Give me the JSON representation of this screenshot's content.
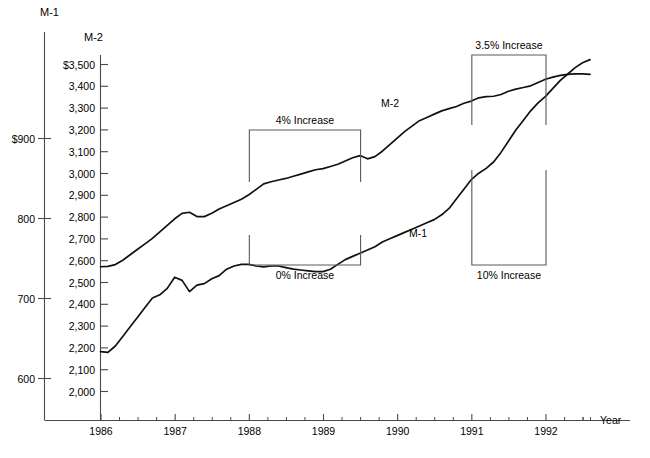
{
  "chart_data": {
    "type": "line",
    "title": "",
    "xlabel": "Year",
    "grid": false,
    "legend_position": "inline-annotations",
    "axes": {
      "x": {
        "label": "Year",
        "tick_labels": [
          "1986",
          "1987",
          "1988",
          "1989",
          "1990",
          "1991",
          "1992"
        ],
        "minor_ticks_per_interval": 4,
        "range": [
          1985.75,
          1992.9
        ]
      },
      "y_left": {
        "name": "M-1",
        "label": "M-1",
        "tick_labels": [
          "$900",
          "800",
          "700",
          "600"
        ],
        "values": [
          900,
          800,
          700,
          600
        ],
        "range": [
          550,
          950
        ]
      },
      "y_right_inner": {
        "name": "M-2",
        "label": "M-2",
        "tick_labels": [
          "$3,500",
          "3,400",
          "3,300",
          "3,200",
          "3,100",
          "3,000",
          "2,900",
          "2,800",
          "2,700",
          "2,600",
          "2,500",
          "2,400",
          "2,300",
          "2,200",
          "2,100",
          "2,000"
        ],
        "values": [
          3500,
          3400,
          3300,
          3200,
          3100,
          3000,
          2900,
          2800,
          2700,
          2600,
          2500,
          2400,
          2300,
          2200,
          2100,
          2000
        ],
        "range": [
          1850,
          3600
        ]
      }
    },
    "series": [
      {
        "name": "M-2",
        "inline_label": "M-2",
        "axis": "y_right_inner",
        "unit": "billions of dollars",
        "x": [
          1986.0,
          1986.1,
          1986.2,
          1986.3,
          1986.4,
          1986.5,
          1986.6,
          1986.7,
          1986.8,
          1986.9,
          1987.0,
          1987.1,
          1987.2,
          1987.3,
          1987.4,
          1987.5,
          1987.6,
          1987.7,
          1987.8,
          1987.9,
          1988.0,
          1988.1,
          1988.2,
          1988.3,
          1988.4,
          1988.5,
          1988.6,
          1988.7,
          1988.8,
          1988.9,
          1989.0,
          1989.1,
          1989.2,
          1989.3,
          1989.4,
          1989.5,
          1989.6,
          1989.7,
          1989.8,
          1989.9,
          1990.0,
          1990.1,
          1990.2,
          1990.3,
          1990.4,
          1990.5,
          1990.6,
          1990.7,
          1990.8,
          1990.9,
          1991.0,
          1991.1,
          1991.2,
          1991.3,
          1991.4,
          1991.5,
          1991.6,
          1991.7,
          1991.8,
          1991.9,
          1992.0,
          1992.1,
          1992.2,
          1992.3,
          1992.4,
          1992.5,
          1992.6
        ],
        "values": [
          2570,
          2572,
          2580,
          2600,
          2625,
          2650,
          2675,
          2700,
          2730,
          2760,
          2790,
          2815,
          2820,
          2800,
          2800,
          2815,
          2835,
          2850,
          2865,
          2880,
          2900,
          2925,
          2950,
          2960,
          2968,
          2975,
          2985,
          2995,
          3005,
          3015,
          3020,
          3030,
          3040,
          3055,
          3070,
          3080,
          3065,
          3075,
          3100,
          3130,
          3160,
          3190,
          3215,
          3240,
          3255,
          3270,
          3285,
          3295,
          3305,
          3320,
          3330,
          3345,
          3350,
          3352,
          3360,
          3375,
          3385,
          3392,
          3400,
          3415,
          3430,
          3440,
          3448,
          3452,
          3455,
          3455,
          3452
        ]
      },
      {
        "name": "M-1",
        "inline_label": "M-1",
        "axis": "y_left",
        "unit": "billions of dollars",
        "x": [
          1986.0,
          1986.1,
          1986.2,
          1986.3,
          1986.4,
          1986.5,
          1986.6,
          1986.7,
          1986.8,
          1986.9,
          1987.0,
          1987.1,
          1987.2,
          1987.3,
          1987.4,
          1987.5,
          1987.6,
          1987.7,
          1987.8,
          1987.9,
          1988.0,
          1988.1,
          1988.2,
          1988.3,
          1988.4,
          1988.5,
          1988.6,
          1988.7,
          1988.8,
          1988.9,
          1989.0,
          1989.1,
          1989.2,
          1989.3,
          1989.4,
          1989.5,
          1989.6,
          1989.7,
          1989.8,
          1989.9,
          1990.0,
          1990.1,
          1990.2,
          1990.3,
          1990.4,
          1990.5,
          1990.6,
          1990.7,
          1990.8,
          1990.9,
          1991.0,
          1991.1,
          1991.2,
          1991.3,
          1991.4,
          1991.5,
          1991.6,
          1991.7,
          1991.8,
          1991.9,
          1992.0,
          1992.1,
          1992.2,
          1992.3,
          1992.4,
          1992.5,
          1992.6
        ],
        "values": [
          633,
          632,
          640,
          652,
          664,
          676,
          688,
          700,
          704,
          712,
          726,
          722,
          708,
          716,
          718,
          724,
          728,
          736,
          740,
          742,
          742,
          740,
          739,
          740,
          740,
          738,
          736,
          735,
          734,
          733,
          733,
          736,
          742,
          748,
          752,
          756,
          760,
          764,
          770,
          774,
          778,
          782,
          786,
          790,
          794,
          798,
          804,
          812,
          824,
          836,
          848,
          856,
          862,
          870,
          882,
          896,
          910,
          922,
          934,
          944,
          952,
          962,
          972,
          980,
          988,
          994,
          998
        ]
      }
    ],
    "annotations": [
      {
        "id": "m2-4pct",
        "label": "4% Increase",
        "series": "M-2",
        "x_start": 1988.0,
        "x_end": 1989.5,
        "orientation": "above"
      },
      {
        "id": "m1-0pct",
        "label": "0% Increase",
        "series": "M-1",
        "x_start": 1988.0,
        "x_end": 1989.5,
        "orientation": "below"
      },
      {
        "id": "m2-35pct",
        "label": "3.5% Increase",
        "series": "M-2",
        "x_start": 1991.0,
        "x_end": 1992.0,
        "orientation": "above"
      },
      {
        "id": "m1-10pct",
        "label": "10% Increase",
        "series": "M-1",
        "x_start": 1991.0,
        "x_end": 1992.0,
        "orientation": "below"
      }
    ]
  },
  "labels": {
    "axis_m1_title": "M-1",
    "axis_m2_title": "M-2",
    "year_axis_title": "Year"
  }
}
